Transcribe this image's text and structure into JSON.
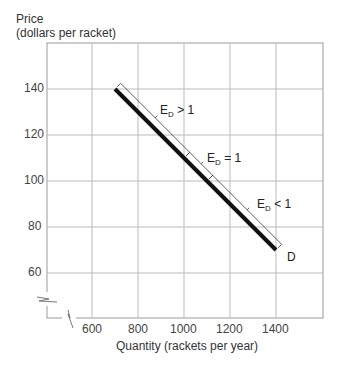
{
  "chart_data": {
    "type": "line",
    "title": "",
    "ylabel_line1": "Price",
    "ylabel_line2": "(dollars per racket)",
    "xlabel": "Quantity (rackets per year)",
    "x_ticks": [
      600,
      800,
      1000,
      1200,
      1400
    ],
    "y_ticks": [
      60,
      80,
      100,
      120,
      140
    ],
    "xlim": [
      400,
      1600
    ],
    "ylim": [
      40,
      160
    ],
    "grid": true,
    "axis_breaks": [
      "x",
      "y"
    ],
    "series": [
      {
        "name": "D",
        "x": [
          700,
          1400
        ],
        "y": [
          140,
          70
        ]
      }
    ],
    "annotations": [
      {
        "text_main": "E",
        "text_sub": "D",
        "text_rel": " > 1",
        "segment": [
          700,
          1000
        ]
      },
      {
        "text_main": "E",
        "text_sub": "D",
        "text_rel": " = 1",
        "segment": [
          1000,
          1100
        ]
      },
      {
        "text_main": "E",
        "text_sub": "D",
        "text_rel": " < 1",
        "segment": [
          1100,
          1400
        ]
      }
    ],
    "curve_label": "D"
  }
}
